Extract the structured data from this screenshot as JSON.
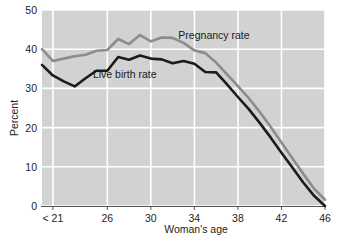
{
  "chart_data": {
    "type": "line",
    "title": "",
    "xlabel": "Woman's age",
    "ylabel": "Percent",
    "xlim": [
      20,
      46
    ],
    "ylim": [
      0,
      50
    ],
    "yticks": [
      0,
      10,
      20,
      30,
      40,
      50
    ],
    "ytick_labels": [
      "0",
      "10",
      "20",
      "30",
      "40",
      "50"
    ],
    "xticks": [
      21,
      26,
      30,
      34,
      38,
      42,
      46
    ],
    "xtick_labels": [
      "< 21",
      "26",
      "30",
      "34",
      "38",
      "42",
      "46"
    ],
    "grid": true,
    "grid_color": "#ffffff",
    "plot_background": "#d2d2d2",
    "legend_position": "inline-annotations",
    "x": [
      20,
      21,
      22,
      23,
      24,
      25,
      26,
      27,
      28,
      29,
      30,
      31,
      32,
      33,
      34,
      35,
      36,
      37,
      38,
      39,
      40,
      41,
      42,
      43,
      44,
      45,
      46
    ],
    "series": [
      {
        "name": "Pregnancy rate",
        "color": "#8c8c8c",
        "label_x": 35.8,
        "label_y": 42.5,
        "values": [
          40.0,
          37.0,
          37.6,
          38.2,
          38.6,
          39.6,
          39.8,
          42.6,
          41.3,
          43.6,
          42.0,
          43.0,
          42.9,
          41.6,
          39.7,
          39.0,
          36.6,
          33.6,
          30.6,
          27.5,
          24.0,
          20.2,
          16.2,
          12.2,
          8.2,
          4.4,
          1.6
        ]
      },
      {
        "name": "Live birth rate",
        "color": "#1b1b1b",
        "label_x": 27.6,
        "label_y": 32.6,
        "values": [
          36.0,
          33.3,
          31.8,
          30.5,
          32.6,
          34.5,
          34.5,
          38.0,
          37.3,
          38.4,
          37.6,
          37.4,
          36.4,
          37.0,
          36.3,
          34.2,
          34.1,
          31.0,
          27.8,
          24.7,
          21.2,
          17.5,
          13.6,
          9.8,
          6.0,
          2.6,
          0.0
        ]
      }
    ]
  },
  "axes": {
    "y_title": "Percent",
    "x_title": "Woman's age"
  }
}
